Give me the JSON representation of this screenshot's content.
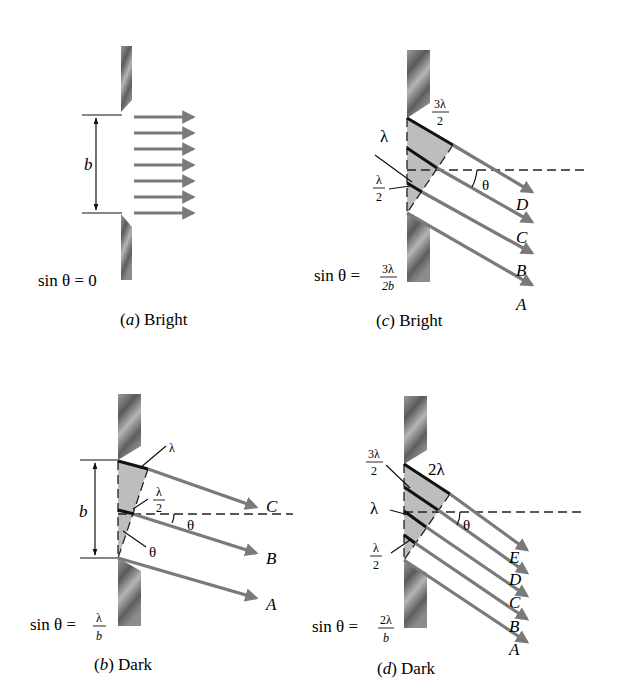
{
  "figure": {
    "colors": {
      "ray": "#7a7a7a",
      "wedge": "#bdbdbd",
      "line": "#111111",
      "slit": "#6e6e6e"
    }
  },
  "panels": {
    "a": {
      "caption_letter": "a",
      "caption_text": "Bright",
      "slit_width_label": "b",
      "equation": "sin θ = 0",
      "ray_count": 7
    },
    "b": {
      "caption_letter": "b",
      "caption_text": "Dark",
      "slit_width_label": "b",
      "equation_lhs": "sin θ =",
      "equation_num": "λ",
      "equation_den": "b",
      "path_labels": {
        "top": "λ",
        "mid_num": "λ",
        "mid_den": "2",
        "angle": "θ",
        "angle_ray": "θ"
      },
      "rays": [
        "C",
        "B",
        "A"
      ]
    },
    "c": {
      "caption_letter": "c",
      "caption_text": "Bright",
      "equation_lhs": "sin θ =",
      "equation_num": "3λ",
      "equation_den": "2b",
      "path_labels": {
        "top_num": "3λ",
        "top_den": "2",
        "mid": "λ",
        "low_num": "λ",
        "low_den": "2",
        "angle": "θ"
      },
      "rays": [
        "D",
        "C",
        "B",
        "A"
      ]
    },
    "d": {
      "caption_letter": "d",
      "caption_text": "Dark",
      "equation_lhs": "sin θ =",
      "equation_num": "2λ",
      "equation_den": "b",
      "path_labels": {
        "top": "2λ",
        "upper_num": "3λ",
        "upper_den": "2",
        "mid": "λ",
        "low_num": "λ",
        "low_den": "2",
        "angle": "θ"
      },
      "rays": [
        "E",
        "D",
        "C",
        "B",
        "A"
      ]
    }
  }
}
